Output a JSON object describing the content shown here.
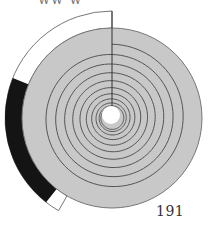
{
  "header": {
    "partial_text": "ww w"
  },
  "footer": {
    "page_number": "191"
  },
  "figure": {
    "type": "spiral-dial",
    "turns": 10,
    "outer_ring": {
      "segments": [
        {
          "name": "white-arc",
          "color": "#ffffff",
          "start_deg": 0,
          "end_deg": 290
        },
        {
          "name": "black-arc",
          "color": "#141414",
          "start_deg": 220,
          "end_deg": 290
        }
      ]
    },
    "colors": {
      "disk_fill": "#c8c8c8",
      "spiral_stroke": "#555555",
      "outline": "#777777",
      "center_hole": "#ffffff",
      "black_band": "#141414"
    }
  }
}
